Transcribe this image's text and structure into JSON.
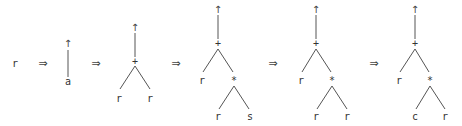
{
  "diagram": {
    "type": "tree-rewriting-sequence",
    "start_symbol": "r",
    "derivation_arrow": "⇒",
    "root_arrow": "↑",
    "stages": [
      {
        "id": "s0",
        "nodes": [
          {
            "label": "r"
          }
        ]
      },
      {
        "id": "s1",
        "root": "a",
        "tree": "a"
      },
      {
        "id": "s2",
        "root": "+",
        "tree": "+(r, r)"
      },
      {
        "id": "s3",
        "root": "+",
        "tree": "+(r, *(r, s))"
      },
      {
        "id": "s4",
        "root": "+",
        "tree": "+(r, *(r, r))"
      },
      {
        "id": "s5",
        "root": "+",
        "tree": "+(r, *(c, r))"
      }
    ]
  },
  "labels": {
    "s0_r": "r",
    "arrow": "⇒",
    "up": "↑",
    "s1_a": "a",
    "s2_plus": "+",
    "s2_left": "r",
    "s2_right": "r",
    "s3_plus": "+",
    "s3_left": "r",
    "s3_star": "*",
    "s3_star_left": "r",
    "s3_star_right": "s",
    "s4_plus": "+",
    "s4_left": "r",
    "s4_star": "*",
    "s4_star_left": "r",
    "s4_star_right": "r",
    "s5_plus": "+",
    "s5_left": "r",
    "s5_star": "*",
    "s5_star_left": "c",
    "s5_star_right": "r"
  },
  "colors": {
    "background": "#ffffff",
    "ink": "#333333",
    "edge": "#555555"
  }
}
